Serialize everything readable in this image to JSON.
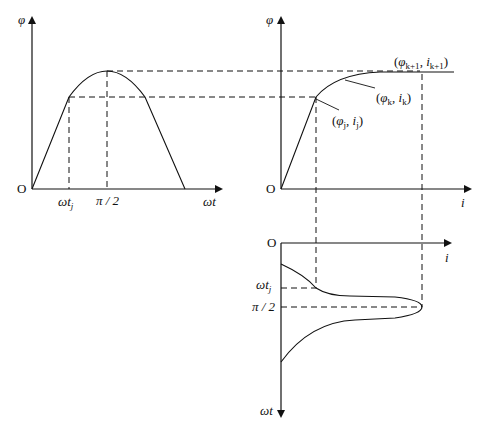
{
  "diagram": {
    "left_panel": {
      "y_axis_label": "φ",
      "x_axis_label": "ωt",
      "origin_label": "O",
      "tick_labels": [
        "ωt_j",
        "π / 2"
      ],
      "tick_j_main": "ωt",
      "tick_j_sub": "j",
      "tick_half_pi": "π / 2"
    },
    "right_panel": {
      "y_axis_label": "φ",
      "x_axis_label": "i",
      "origin_label": "O",
      "point_j": "(φj, ij)",
      "point_k": "(φk, ik)",
      "point_k1": "(φk+1, ik+1)",
      "pj_phi": "φ",
      "pj_sub": "j",
      "pj_i": "i",
      "pj_isub": "j",
      "pk_phi": "φ",
      "pk_sub": "k",
      "pk_i": "i",
      "pk_isub": "k",
      "pk1_phi": "φ",
      "pk1_sub": "k+1",
      "pk1_i": "i",
      "pk1_isub": "k+1"
    },
    "bottom_panel": {
      "x_axis_label": "i",
      "y_axis_label": "ωt",
      "origin_label": "O",
      "tick_j_main": "ωt",
      "tick_j_sub": "j",
      "tick_half_pi": "π / 2"
    }
  }
}
